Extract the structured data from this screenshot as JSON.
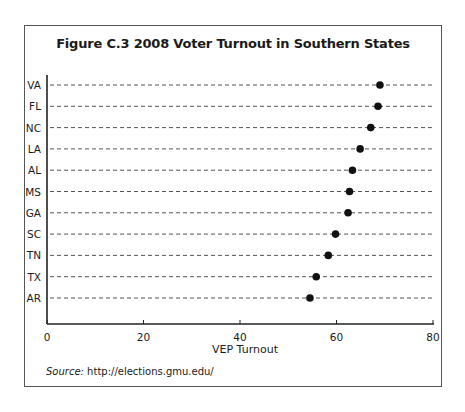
{
  "chart_data": {
    "type": "scatter",
    "subtype": "dot-plot",
    "title": "Figure C.3  2008 Voter Turnout in Southern States",
    "xlabel": "VEP Turnout",
    "ylabel": "",
    "xlim": [
      0,
      80
    ],
    "xticks": [
      0,
      20,
      40,
      60,
      80
    ],
    "categories": [
      "VA",
      "FL",
      "NC",
      "LA",
      "AL",
      "MS",
      "GA",
      "SC",
      "TN",
      "TX",
      "AR"
    ],
    "values": [
      69.0,
      68.6,
      67.1,
      64.9,
      63.3,
      62.7,
      62.4,
      59.8,
      58.3,
      55.8,
      54.5
    ],
    "gridlines": "dashed horizontal per category",
    "legend": null,
    "source_label": "Source:",
    "source_text": " http://elections.gmu.edu/"
  },
  "colors": {
    "dot": "#111111",
    "grid": "#555555",
    "axis": "#222222",
    "frame": "#555555"
  }
}
